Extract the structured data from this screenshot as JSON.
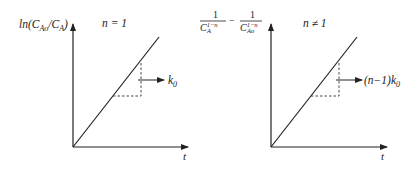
{
  "panels": [
    {
      "id": "first-order",
      "condition": "n = 1",
      "ylabel": {
        "prefix": "ln(C",
        "sub1": "Ao",
        "mid": "/C",
        "sub2": "A",
        "suffix": ")"
      },
      "xlabel": "t",
      "slope_label": {
        "main": "k",
        "sub": "0"
      }
    },
    {
      "id": "nth-order",
      "condition": "n ≠ 1",
      "ylabel": {
        "num1": "1",
        "den1_base": "C",
        "den1_sup": "1−n",
        "den1_sub": "A",
        "minus": "−",
        "num2": "1",
        "den2_base": "C",
        "den2_sup": "1−n",
        "den2_sub": "Ao"
      },
      "xlabel": "t",
      "slope_label": {
        "main": "(n−1)k",
        "sub": "0"
      }
    }
  ]
}
